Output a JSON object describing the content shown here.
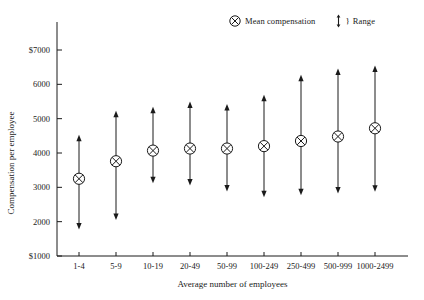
{
  "legend": {
    "mean_symbol_name": "circled-x-icon",
    "mean_label": "Mean compensation",
    "range_symbol_name": "double-arrow-icon",
    "range_brace": "}",
    "range_label": "Range"
  },
  "chart_data": {
    "type": "scatter",
    "title": "",
    "xlabel": "Average number of employees",
    "ylabel": "Compensation per employee",
    "categories": [
      "1-4",
      "5-9",
      "10-19",
      "20-49",
      "50-99",
      "100-249",
      "250-499",
      "500-999",
      "1000-2499"
    ],
    "ylim": [
      1000,
      7000
    ],
    "yticks": [
      1000,
      2000,
      3000,
      4000,
      5000,
      6000,
      7000
    ],
    "ytick_labels": [
      "$1000",
      "2000",
      "3000",
      "4000",
      "5000",
      "6000",
      "$7000"
    ],
    "grid": false,
    "legend_position": "top-right",
    "series": [
      {
        "name": "Mean compensation",
        "values": [
          3250,
          3760,
          4070,
          4130,
          4130,
          4200,
          4350,
          4480,
          4720
        ]
      },
      {
        "name": "Range low",
        "values": [
          1800,
          2080,
          3150,
          3080,
          2910,
          2740,
          2800,
          2850,
          2900
        ]
      },
      {
        "name": "Range high",
        "values": [
          4500,
          5200,
          5320,
          5470,
          5400,
          5670,
          6250,
          6430,
          6520
        ]
      }
    ]
  }
}
